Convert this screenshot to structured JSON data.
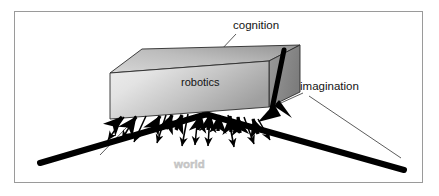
{
  "figure": {
    "kind": "concept-diagram",
    "title_visible": false,
    "background_color": "#ffffff",
    "frame": {
      "border_color": "#9a9a9a",
      "x": 14,
      "y": 11,
      "width": 409,
      "height": 172
    }
  },
  "labels": {
    "cognition": "cognition",
    "imagination": "imagination",
    "robotics": "robotics",
    "world": "world"
  },
  "colors": {
    "line": "#000000",
    "box_front_light": "#e9e9e9",
    "box_front_dark": "#a8a8a8",
    "box_top_light": "#cfcfcf",
    "box_top_dark": "#9b9b9b",
    "box_side": "#8f8f8f",
    "world_text": "#c9c9c9",
    "text": "#141414",
    "frame": "#9a9a9a"
  },
  "elements": {
    "box": {
      "name": "robotics-box",
      "shape": "3d-cuboid",
      "front_face": [
        [
          110,
          73
        ],
        [
          269,
          61
        ],
        [
          269,
          107
        ],
        [
          110,
          119
        ]
      ],
      "top_face": [
        [
          110,
          73
        ],
        [
          142,
          49
        ],
        [
          300,
          45
        ],
        [
          269,
          61
        ]
      ],
      "right_face": [
        [
          269,
          61
        ],
        [
          300,
          45
        ],
        [
          300,
          92
        ],
        [
          269,
          107
        ]
      ]
    },
    "ground": {
      "name": "world-ground-line",
      "description": "thick black V-shaped horizon line",
      "left_segment": [
        [
          40,
          163
        ],
        [
          206,
          114
        ]
      ],
      "right_segment": [
        [
          206,
          114
        ],
        [
          404,
          170
        ]
      ],
      "stroke_width": 6
    },
    "box_right_edge": {
      "name": "box-right-vertical-edge",
      "from": [
        283,
        52
      ],
      "to": [
        272,
        108
      ],
      "stroke_width": 5
    },
    "leader_lines": [
      {
        "name": "cognition-leader",
        "from": [
          236,
          34
        ],
        "to": [
          222,
          49
        ]
      },
      {
        "name": "imagination-leader",
        "from": [
          303,
          93
        ],
        "to": [
          272,
          106
        ]
      },
      {
        "name": "imagination-leader-long",
        "from": [
          310,
          96
        ],
        "to": [
          400,
          157
        ]
      },
      {
        "name": "robotics-leader",
        "from": [
          152,
          101
        ],
        "to": [
          100,
          155
        ]
      }
    ],
    "arrows_up": {
      "name": "arrows-toward-box",
      "count": 11,
      "description": "short thick arrows pointing up-left/up-right into the box underside"
    },
    "arrows_down": {
      "name": "arrows-toward-world",
      "count": 10,
      "description": "thin arrows pointing down away from the box toward the world"
    }
  }
}
